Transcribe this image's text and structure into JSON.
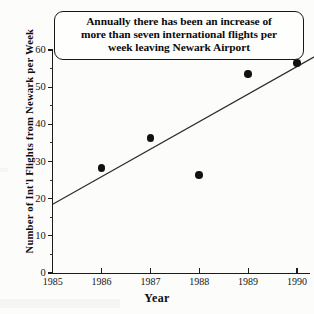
{
  "chart_data": {
    "type": "scatter",
    "title": "",
    "annotation": {
      "lines": [
        "Annually there has been an increase of",
        "more than seven international flights per",
        "week leaving Newark Airport"
      ]
    },
    "xlabel": "Year",
    "ylabel": "Number of Int'l Flights from Newark per Week",
    "x": [
      1986,
      1987,
      1988,
      1989,
      1990
    ],
    "values": [
      28.3,
      36.3,
      26.3,
      53.5,
      56.5
    ],
    "series": [
      {
        "name": "International flights per week",
        "x": [
          1986,
          1987,
          1988,
          1989,
          1990
        ],
        "values": [
          28.3,
          36.3,
          26.3,
          53.5,
          56.5
        ]
      }
    ],
    "trend_line": {
      "type": "linear",
      "x_start": 1985.0,
      "y_start": 18.5,
      "x_end": 1990.4,
      "y_end": 58.5,
      "slope_per_year": 7.4
    },
    "xlim": [
      1985,
      1990.3
    ],
    "ylim": [
      0,
      60
    ],
    "x_ticks": [
      1985,
      1986,
      1987,
      1988,
      1989,
      1990
    ],
    "x_tick_labels": [
      "1985",
      "1986",
      "1987",
      "1988",
      "1989",
      "1990"
    ],
    "y_ticks": [
      0,
      10,
      20,
      30,
      40,
      50,
      60
    ],
    "y_tick_labels": [
      "0",
      "10",
      "20",
      "30",
      "40",
      "50",
      "60"
    ],
    "y_minor_ticks": [
      5,
      15,
      25,
      35,
      45,
      55
    ],
    "grid": false,
    "legend": null,
    "marker": "filled-circle",
    "colors": {
      "marker": "#121214",
      "trend_line": "#2a2a2d",
      "axis": "#1b1b1d",
      "text": "#0d0d0f",
      "background": "#fcfcfa",
      "annotation_border": "#18181a"
    }
  }
}
